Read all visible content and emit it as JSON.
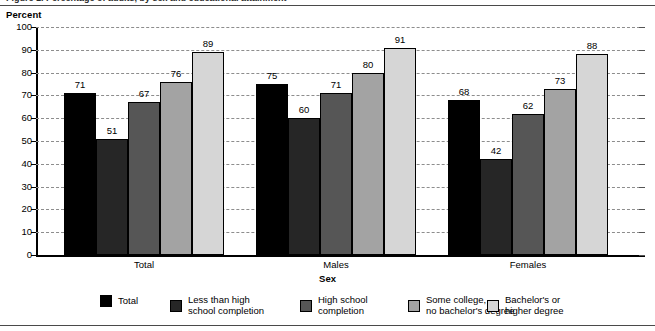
{
  "figure": {
    "cut_title": "Figure 1.  Percentage of adults, by sex and educational attainment",
    "yaxis_title": "Percent",
    "xaxis_title": "Sex"
  },
  "legend": {
    "items": [
      {
        "label": "Total",
        "color": "#000000"
      },
      {
        "label": "Less than high\nschool completion",
        "color": "#262626"
      },
      {
        "label": "High school\ncompletion",
        "color": "#565656"
      },
      {
        "label": "Some college,\nno bachelor's degree",
        "color": "#a3a3a3"
      },
      {
        "label": "Bachelor's or\nhigher degree",
        "color": "#d6d6d6"
      }
    ]
  },
  "chart_data": {
    "type": "bar",
    "title": "",
    "xlabel": "Sex",
    "ylabel": "Percent",
    "ylim": [
      0,
      100
    ],
    "ytick_step": 10,
    "yticks": [
      0,
      10,
      20,
      30,
      40,
      50,
      60,
      70,
      80,
      90,
      100
    ],
    "grid": true,
    "legend_position": "bottom",
    "categories": [
      "Total",
      "Males",
      "Females"
    ],
    "series": [
      {
        "name": "Total",
        "color": "#000000",
        "values": [
          71,
          75,
          68
        ]
      },
      {
        "name": "Less than high school completion",
        "color": "#262626",
        "values": [
          51,
          60,
          42
        ]
      },
      {
        "name": "High school completion",
        "color": "#565656",
        "values": [
          67,
          71,
          62
        ]
      },
      {
        "name": "Some college, no bachelor's degree",
        "color": "#a3a3a3",
        "values": [
          76,
          80,
          73
        ]
      },
      {
        "name": "Bachelor's or higher degree",
        "color": "#d6d6d6",
        "values": [
          89,
          91,
          88
        ]
      }
    ]
  }
}
